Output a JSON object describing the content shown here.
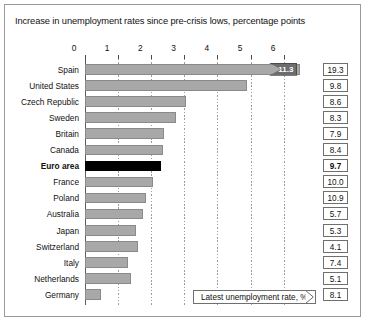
{
  "chart": {
    "title": "Increase in unemployment rates since pre-crisis lows, percentage points",
    "legend_label": "Latest unemployment rate, %",
    "spain_break_label": "11.3",
    "colors": {
      "bar": "#a8a8a8",
      "bar_border": "#8a8a8a",
      "highlight_bar": "#000000",
      "frame_border": "#9a9a9a",
      "gridline": "#9d9d9d",
      "text": "#111111"
    }
  },
  "chart_data": {
    "type": "bar",
    "orientation": "horizontal",
    "title": "Increase in unemployment rates since pre-crisis lows, percentage points",
    "xlabel": "",
    "ylabel": "",
    "xlim": [
      0,
      6.5
    ],
    "xticks": [
      "0",
      "1",
      "2",
      "3",
      "4",
      "5",
      "6"
    ],
    "xtick_values": [
      0,
      1,
      2,
      3,
      4,
      5,
      6
    ],
    "grid": true,
    "legend_position": "bottom-right",
    "categories": [
      "Spain",
      "United States",
      "Czech Republic",
      "Sweden",
      "Britain",
      "Canada",
      "Euro area",
      "France",
      "Poland",
      "Australia",
      "Japan",
      "Switzerland",
      "Italy",
      "Netherlands",
      "Germany"
    ],
    "series": [
      {
        "name": "Increase in unemployment rate since pre-crisis low, percentage points",
        "values": [
          11.3,
          4.9,
          3.05,
          2.75,
          2.4,
          2.35,
          2.3,
          2.05,
          1.85,
          1.75,
          1.55,
          1.6,
          1.3,
          1.4,
          0.5
        ]
      },
      {
        "name": "Latest unemployment rate, %",
        "values": [
          19.3,
          9.8,
          8.6,
          8.3,
          7.9,
          8.4,
          9.7,
          10.0,
          10.9,
          5.7,
          5.3,
          4.1,
          7.4,
          5.1,
          8.1
        ]
      }
    ],
    "highlight_category": "Euro area",
    "axis_break": {
      "category": "Spain",
      "label": "11.3",
      "note": "Spain bar is truncated at the axis maximum with a value flag"
    },
    "rows": [
      {
        "label": "Spain",
        "increase": 11.3,
        "latest": "19.3",
        "highlight": false,
        "truncated": true
      },
      {
        "label": "United States",
        "increase": 4.9,
        "latest": "9.8",
        "highlight": false,
        "truncated": false
      },
      {
        "label": "Czech Republic",
        "increase": 3.05,
        "latest": "8.6",
        "highlight": false,
        "truncated": false
      },
      {
        "label": "Sweden",
        "increase": 2.75,
        "latest": "8.3",
        "highlight": false,
        "truncated": false
      },
      {
        "label": "Britain",
        "increase": 2.4,
        "latest": "7.9",
        "highlight": false,
        "truncated": false
      },
      {
        "label": "Canada",
        "increase": 2.35,
        "latest": "8.4",
        "highlight": false,
        "truncated": false
      },
      {
        "label": "Euro area",
        "increase": 2.3,
        "latest": "9.7",
        "highlight": true,
        "truncated": false
      },
      {
        "label": "France",
        "increase": 2.05,
        "latest": "10.0",
        "highlight": false,
        "truncated": false
      },
      {
        "label": "Poland",
        "increase": 1.85,
        "latest": "10.9",
        "highlight": false,
        "truncated": false
      },
      {
        "label": "Australia",
        "increase": 1.75,
        "latest": "5.7",
        "highlight": false,
        "truncated": false
      },
      {
        "label": "Japan",
        "increase": 1.55,
        "latest": "5.3",
        "highlight": false,
        "truncated": false
      },
      {
        "label": "Switzerland",
        "increase": 1.6,
        "latest": "4.1",
        "highlight": false,
        "truncated": false
      },
      {
        "label": "Italy",
        "increase": 1.3,
        "latest": "7.4",
        "highlight": false,
        "truncated": false
      },
      {
        "label": "Netherlands",
        "increase": 1.4,
        "latest": "5.1",
        "highlight": false,
        "truncated": false
      },
      {
        "label": "Germany",
        "increase": 0.5,
        "latest": "8.1",
        "highlight": false,
        "truncated": false
      }
    ]
  }
}
